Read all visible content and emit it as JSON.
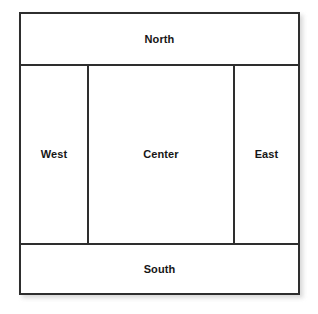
{
  "diagram": {
    "type": "border-layout",
    "background_color": "#ffffff",
    "line_color": "#2e2e2e",
    "text_color": "#161616",
    "regions": [
      {
        "id": "north",
        "label": "North",
        "position": "top",
        "span": "full-width"
      },
      {
        "id": "west",
        "label": "West",
        "position": "left",
        "span": "middle-row"
      },
      {
        "id": "center",
        "label": "Center",
        "position": "center",
        "span": "middle-row"
      },
      {
        "id": "east",
        "label": "East",
        "position": "right",
        "span": "middle-row"
      },
      {
        "id": "south",
        "label": "South",
        "position": "bottom",
        "span": "full-width"
      }
    ]
  }
}
